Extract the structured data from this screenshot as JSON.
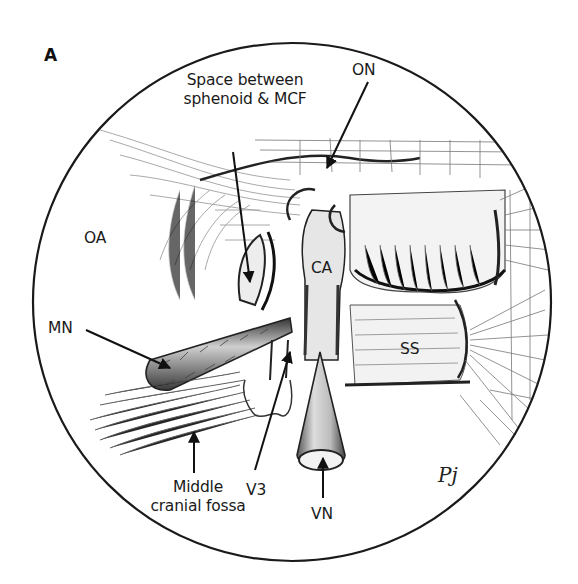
{
  "figure": {
    "panel_letter": "A",
    "view": "endoscopic circular view",
    "colors": {
      "outline": "#1a1a1a",
      "background": "#ffffff",
      "shading": "#555555"
    },
    "labels": {
      "space": {
        "line1": "Space between",
        "line2": "sphenoid & MCF"
      },
      "on": "ON",
      "oa": "OA",
      "ca": "CA",
      "mn": "MN",
      "ss": "SS",
      "middle_fossa": {
        "line1": "Middle",
        "line2": "cranial fossa"
      },
      "v3": "V3",
      "vn": "VN"
    },
    "signature": "Pj"
  }
}
